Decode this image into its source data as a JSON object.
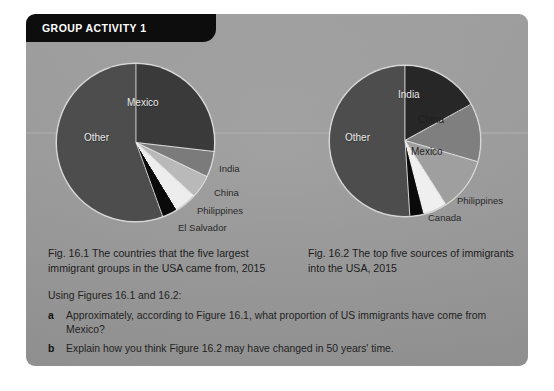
{
  "panel": {
    "tab_label": "GROUP ACTIVITY 1",
    "background_color": "#9b9b9b",
    "tab_color": "#0d0d0d"
  },
  "figure_1": {
    "caption": "Fig. 16.1 The countries that the five largest immigrant groups in the USA came from, 2015",
    "labels": {
      "other": "Other",
      "mexico": "Mexico",
      "india": "India",
      "china": "China",
      "philippines": "Philippines",
      "el_salvador": "El Salvador"
    }
  },
  "figure_2": {
    "caption": "Fig. 16.2 The top five sources of immigrants into the USA, 2015",
    "labels": {
      "other": "Other",
      "india": "India",
      "china": "China",
      "mexico": "Mexico",
      "philippines": "Philippines",
      "canada": "Canada"
    }
  },
  "questions": {
    "intro": "Using Figures 16.1 and 16.2:",
    "items": [
      {
        "marker": "a",
        "text": "Approximately, according to Figure 16.1, what proportion of US immigrants have come from Mexico?"
      },
      {
        "marker": "b",
        "text": "Explain how you think Figure 16.2 may have changed in 50 years' time."
      }
    ]
  },
  "chart_data": [
    {
      "type": "pie",
      "title": "Fig. 16.1 The countries that the five largest immigrant groups in the USA came from, 2015",
      "categories": [
        "Mexico",
        "India",
        "China",
        "Philippines",
        "El Salvador",
        "Other"
      ],
      "values": [
        26.8,
        5.3,
        4.8,
        4.4,
        3.2,
        55.5
      ],
      "unit": "percent",
      "colors": [
        "#3a3a3a",
        "#7b7b7b",
        "#b9b9b9",
        "#ededed",
        "#0a0a0a",
        "#4d4d4d"
      ],
      "start_angle_deg": 0,
      "direction": "clockwise",
      "legend": "none",
      "labels_position": "in-slice-and-leader"
    },
    {
      "type": "pie",
      "title": "Fig. 16.2 The top five sources of immigrants into the USA, 2015",
      "categories": [
        "India",
        "China",
        "Mexico",
        "Philippines",
        "Canada",
        "Other"
      ],
      "values": [
        17.0,
        12.5,
        11.5,
        5.0,
        3.0,
        51.0
      ],
      "unit": "percent",
      "colors": [
        "#272727",
        "#7f7f7f",
        "#9f9f9f",
        "#efefef",
        "#0a0a0a",
        "#4d4d4d"
      ],
      "start_angle_deg": 0,
      "direction": "clockwise",
      "legend": "none",
      "labels_position": "in-slice-and-leader"
    }
  ]
}
